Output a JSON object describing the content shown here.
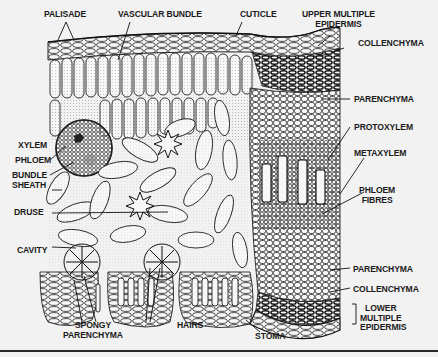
{
  "figure": {
    "labels": {
      "palisade": "PALISADE",
      "vascular_bundle": "VASCULAR BUNDLE",
      "cuticle": "CUTICLE",
      "upper_multiple_epidermis_1": "UPPER MULTIPLE",
      "upper_multiple_epidermis_2": "EPIDERMIS",
      "collenchyma_top": "COLLENCHYMA",
      "parenchyma_top": "PARENCHYMA",
      "protoxylem": "PROTOXYLEM",
      "metaxylem": "METAXYLEM",
      "phloem_fibres_1": "PHLOEM",
      "phloem_fibres_2": "FIBRES",
      "parenchyma_bottom": "PARENCHYMA",
      "collenchyma_bottom": "COLLENCHYMA",
      "lower_multiple_epidermis_1": "LOWER",
      "lower_multiple_epidermis_2": "MULTIPLE",
      "lower_multiple_epidermis_3": "EPIDERMIS",
      "xylem": "XYLEM",
      "phloem": "PHLOEM",
      "bundle_sheath_1": "BUNDLE",
      "bundle_sheath_2": "SHEATH",
      "druse": "DRUSE",
      "cavity": "CAVITY",
      "spongy_parenchyma_1": "SPONGY",
      "spongy_parenchyma_2": "PARENCHYMA",
      "hairs": "HAIRS",
      "stoma": "STOMA"
    },
    "colors": {
      "background": "#f2f2f2",
      "ink": "#1a1a1a"
    }
  }
}
